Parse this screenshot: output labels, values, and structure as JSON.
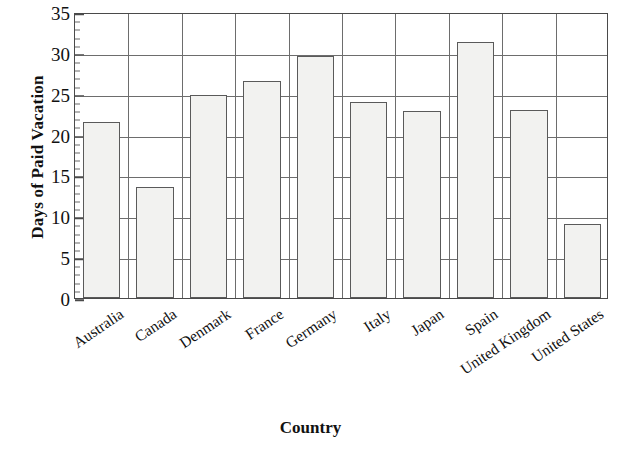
{
  "chart_data": {
    "type": "bar",
    "title": "",
    "xlabel": "Country",
    "ylabel": "Days of Paid Vacation",
    "categories": [
      "Australia",
      "Canada",
      "Denmark",
      "France",
      "Germany",
      "Italy",
      "Japan",
      "Spain",
      "United Kingdom",
      "United States"
    ],
    "values": [
      21.5,
      13.6,
      24.8,
      26.5,
      29.6,
      24.0,
      22.9,
      31.3,
      23.0,
      9.0
    ],
    "ylim": [
      0,
      35
    ],
    "ytick_major": [
      0,
      5,
      10,
      15,
      20,
      25,
      30,
      35
    ],
    "ytick_major_labels": [
      "0",
      "5",
      "10",
      "15",
      "20",
      "25",
      "30",
      "35"
    ],
    "ytick_minor_step": 1,
    "grid": "both",
    "legend": "none",
    "bar_fill": "#f2f2f0",
    "bar_edge": "#5a5a5a",
    "grid_color": "#6d6d6d",
    "axis_color": "#4a4a4a",
    "xlabel_rotation": -34
  }
}
